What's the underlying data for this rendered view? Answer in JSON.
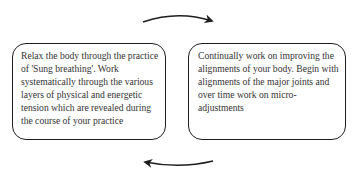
{
  "diagram": {
    "type": "cycle",
    "boxes": [
      {
        "id": "left",
        "text": "Relax the body through the practice of 'Sung breathing'. Work systematically through the various layers of physical and energetic tension which are revealed during the course of your practice"
      },
      {
        "id": "right",
        "text": "Continually work on improving the alignments of your body. Begin with alignments of the major joints and over time work on micro-adjustments"
      }
    ],
    "arrows": [
      {
        "from": "left",
        "to": "right",
        "position": "top",
        "direction": "left-to-right"
      },
      {
        "from": "right",
        "to": "left",
        "position": "bottom",
        "direction": "right-to-left"
      }
    ],
    "colors": {
      "stroke": "#1e1e1e",
      "text": "#333333",
      "background": "#ffffff"
    }
  }
}
